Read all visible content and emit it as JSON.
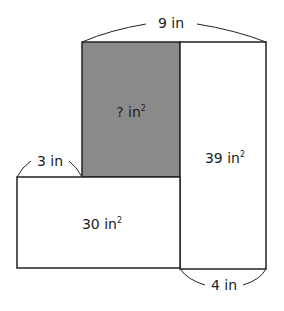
{
  "diagram": {
    "type": "composite rectangle area figure",
    "colors": {
      "shaded": "#8a8a8a",
      "stroke": "#222222",
      "background": "#ffffff"
    },
    "regions": {
      "shaded": {
        "label": "? in",
        "exponent": "2"
      },
      "right": {
        "label": "39 in",
        "exponent": "2"
      },
      "left": {
        "label": "30 in",
        "exponent": "2"
      }
    },
    "dimensions": {
      "top": "9 in",
      "left_step": "3 in",
      "bottom_right": "4 in"
    }
  }
}
